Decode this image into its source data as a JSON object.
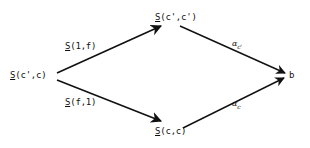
{
  "diagram": {
    "type": "commutative-diagram",
    "nodes": {
      "left": {
        "functor": "S",
        "args": "(c',c)"
      },
      "top": {
        "functor": "S",
        "args": "(c',c')"
      },
      "bottom": {
        "functor": "S",
        "args": "(c,c)"
      },
      "right": {
        "text": "b"
      }
    },
    "edges": {
      "left_top": {
        "functor": "S",
        "args": "(1,f)"
      },
      "left_bottom": {
        "functor": "S",
        "args": "(f,1)"
      },
      "top_right": {
        "symbol": "α",
        "subscript": "c'"
      },
      "bottom_right": {
        "symbol": "α",
        "subscript": "c"
      }
    },
    "colors": {
      "ink": "#111111",
      "background": "#ffffff"
    }
  }
}
